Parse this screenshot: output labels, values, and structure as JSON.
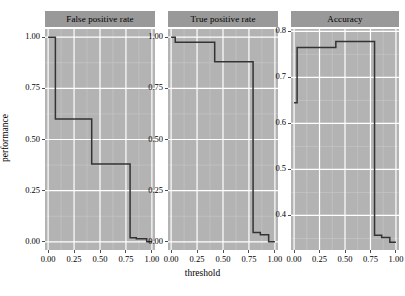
{
  "chart_data": {
    "type": "line",
    "title": "",
    "xlabel": "threshold",
    "ylabel": "performance",
    "grid": true,
    "legend": "none",
    "facet_layout": "1 row x 3 columns, free y scales",
    "panels": [
      {
        "label": "False positive rate",
        "xlabel": "threshold",
        "ylabel": "performance",
        "xlim": [
          -0.03,
          1.03
        ],
        "ylim": [
          -0.04,
          1.04
        ],
        "xticks": [
          0.0,
          0.25,
          0.5,
          0.75,
          1.0
        ],
        "xticklabels": [
          "0.00",
          "0.25",
          "0.50",
          "0.75",
          "1.00"
        ],
        "yticks": [
          0.0,
          0.25,
          0.5,
          0.75,
          1.0
        ],
        "yticklabels": [
          "0.00",
          "0.25",
          "0.50",
          "0.75",
          "1.00"
        ],
        "step_style": "hv",
        "x": [
          0.0,
          0.07,
          0.07,
          0.42,
          0.42,
          0.79,
          0.79,
          0.85,
          0.85,
          0.95,
          0.95,
          1.0
        ],
        "y": [
          1.0,
          1.0,
          0.6,
          0.6,
          0.38,
          0.38,
          0.02,
          0.02,
          0.015,
          0.015,
          0.0,
          0.0
        ]
      },
      {
        "label": "True positive rate",
        "xlabel": "threshold",
        "ylabel": "performance",
        "xlim": [
          -0.03,
          1.03
        ],
        "ylim": [
          -0.04,
          1.04
        ],
        "xticks": [
          0.0,
          0.25,
          0.5,
          0.75,
          1.0
        ],
        "xticklabels": [
          "0.00",
          "0.25",
          "0.50",
          "0.75",
          "1.00"
        ],
        "yticks": [
          0.0,
          0.25,
          0.5,
          0.75,
          1.0
        ],
        "yticklabels": [
          "0.00",
          "0.25",
          "0.50",
          "0.75",
          "1.00"
        ],
        "step_style": "hv",
        "x": [
          0.0,
          0.04,
          0.04,
          0.42,
          0.42,
          0.79,
          0.79,
          0.86,
          0.86,
          0.94,
          0.94,
          1.0
        ],
        "y": [
          1.0,
          1.0,
          0.975,
          0.975,
          0.88,
          0.88,
          0.045,
          0.045,
          0.035,
          0.035,
          0.0,
          0.0
        ]
      },
      {
        "label": "Accuracy",
        "xlabel": "threshold",
        "ylabel": "performance",
        "xlim": [
          -0.03,
          1.03
        ],
        "ylim": [
          0.325,
          0.805
        ],
        "xticks": [
          0.0,
          0.25,
          0.5,
          0.75,
          1.0
        ],
        "xticklabels": [
          "0.00",
          "0.25",
          "0.50",
          "0.75",
          "1.00"
        ],
        "yticks": [
          0.4,
          0.5,
          0.6,
          0.7,
          0.8
        ],
        "yticklabels": [
          "0.4",
          "0.5",
          "0.6",
          "0.7",
          "0.8"
        ],
        "step_style": "hv",
        "x": [
          0.0,
          0.03,
          0.03,
          0.41,
          0.41,
          0.79,
          0.79,
          0.86,
          0.86,
          0.94,
          0.94,
          1.0
        ],
        "y": [
          0.645,
          0.645,
          0.765,
          0.765,
          0.778,
          0.778,
          0.357,
          0.357,
          0.352,
          0.352,
          0.342,
          0.342
        ]
      }
    ],
    "colors": {
      "panel_background": "#b3b3b3",
      "strip_background": "#999999",
      "grid_major": "#ffffff",
      "grid_minor": "#c6c6c6",
      "line": "#333333",
      "text": "#000000",
      "page_background": "#ffffff"
    }
  }
}
